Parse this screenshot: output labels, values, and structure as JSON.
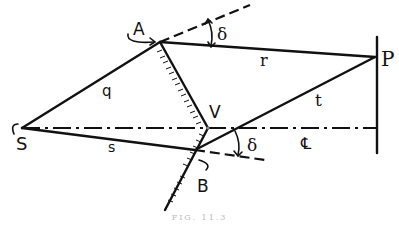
{
  "figure": {
    "type": "ray-geometry diagram (biprism / mirror path difference)",
    "points": {
      "S": {
        "label": "S",
        "x": 22,
        "y": 128
      },
      "A": {
        "label": "A",
        "x": 160,
        "y": 42
      },
      "V": {
        "label": "V",
        "x": 208,
        "y": 128
      },
      "B": {
        "label": "B",
        "x": 195,
        "y": 172
      },
      "P": {
        "label": "P",
        "x": 375,
        "y": 57
      },
      "C": {
        "x": 232,
        "y": 128
      }
    },
    "segment_labels": {
      "q": "q",
      "r": "r",
      "s": "s",
      "t": "t"
    },
    "angle_labels": {
      "delta_top": "δ",
      "delta_bottom": "δ"
    },
    "axis_label": "℄",
    "caption": "FIG. 11.3"
  }
}
